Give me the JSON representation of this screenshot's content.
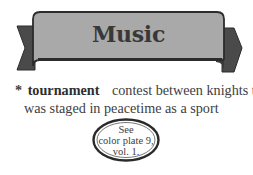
{
  "banner": {
    "title": "Music",
    "colors": {
      "fill": "#a9a9a9",
      "tail": "#4a4a4a",
      "outline": "#2c2c2c"
    }
  },
  "definition": {
    "marker": "*",
    "term": "tournament",
    "text_line1": "contest between knights that",
    "text_line2": "was staged in peacetime as a sport"
  },
  "cross_reference": {
    "line1": "See",
    "line2": "color plate 9,",
    "line3": "vol. 1."
  }
}
